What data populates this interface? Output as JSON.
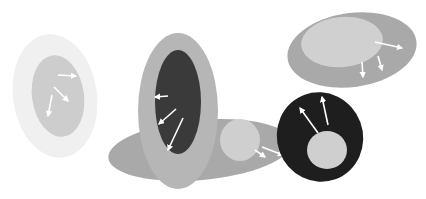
{
  "diagram": {
    "background": "#ffffff",
    "arrow_color": "#ffffff",
    "shapes": [
      {
        "name": "cell-faint",
        "outer": {
          "cx": 55,
          "cy": 96,
          "rx": 42,
          "ry": 62,
          "rot": -8,
          "fill": "#f0f0f0"
        },
        "inner": {
          "cx": 58,
          "cy": 96,
          "rx": 26,
          "ry": 41,
          "rot": -8,
          "fill": "#cdcdcd"
        },
        "arrows": [
          [
            58,
            75,
            76,
            76
          ],
          [
            54,
            87,
            68,
            101
          ],
          [
            52,
            95,
            48,
            116
          ]
        ]
      },
      {
        "name": "cell-background-wide",
        "outer": {
          "cx": 200,
          "cy": 150,
          "rx": 92,
          "ry": 30,
          "rot": -5,
          "fill": "#a9a9a9"
        }
      },
      {
        "name": "cell-tall",
        "outer": {
          "cx": 178,
          "cy": 111,
          "rx": 40,
          "ry": 78,
          "rot": 0,
          "fill": "#b6b6b6"
        },
        "inner": {
          "cx": 178,
          "cy": 102,
          "rx": 23,
          "ry": 52,
          "rot": 0,
          "fill": "#3a3a3a"
        },
        "arrows": [
          [
            168,
            96,
            155,
            97
          ],
          [
            176,
            109,
            159,
            124
          ],
          [
            183,
            118,
            168,
            150
          ]
        ]
      },
      {
        "name": "cell-small-circle",
        "inner": {
          "cx": 240,
          "cy": 140,
          "rx": 20,
          "ry": 21,
          "rot": 0,
          "fill": "#cfcfcf"
        },
        "arrows": [
          [
            255,
            150,
            265,
            157
          ],
          [
            262,
            147,
            283,
            155
          ]
        ]
      },
      {
        "name": "cell-top-right",
        "outer": {
          "cx": 352,
          "cy": 50,
          "rx": 65,
          "ry": 37,
          "rot": -8,
          "fill": "#a9a9a9"
        },
        "inner": {
          "cx": 342,
          "cy": 42,
          "rx": 41,
          "ry": 25,
          "rot": -5,
          "fill": "#d0d0d0"
        },
        "arrows": [
          [
            375,
            42,
            402,
            48
          ],
          [
            362,
            62,
            363,
            77
          ],
          [
            378,
            56,
            382,
            70
          ]
        ]
      },
      {
        "name": "cell-dark-ring",
        "outer": {
          "cx": 320,
          "cy": 137,
          "rx": 43,
          "ry": 45,
          "rot": -20,
          "fill": "#1e1e1e"
        },
        "inner": {
          "cx": 327,
          "cy": 150,
          "rx": 20,
          "ry": 19,
          "rot": 0,
          "fill": "#cfcfcf"
        },
        "arrows": [
          [
            318,
            133,
            300,
            108
          ],
          [
            328,
            125,
            322,
            97
          ]
        ]
      }
    ]
  }
}
